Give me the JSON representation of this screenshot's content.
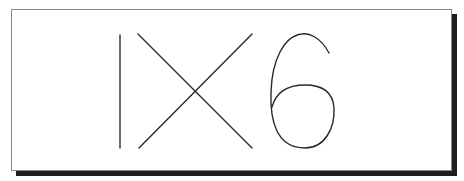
{
  "captcha": {
    "text": "IX6",
    "characters": [
      "I",
      "X",
      "6"
    ],
    "stroke_color": "#2a2a2a",
    "background_color": "#ffffff",
    "border_color": "#8a8a8a",
    "shadow_color": "#1e1e1e"
  }
}
